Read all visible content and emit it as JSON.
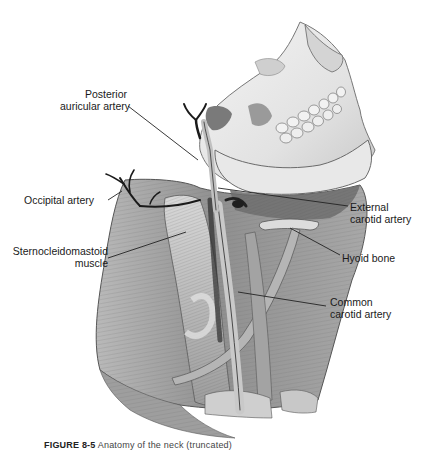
{
  "figure": {
    "style": "grayscale pencil illustration",
    "colors": {
      "background": "#ffffff",
      "text": "#1a1a1a",
      "leader_line": "#222222",
      "bone": "#e6e6e6",
      "muscle": "#9a9a9a",
      "artery": "#2a2a2a"
    }
  },
  "labels": {
    "posterior_auricular": {
      "line1": "Posterior",
      "line2": "auricular artery"
    },
    "occipital": {
      "line1": "Occipital artery"
    },
    "sternocleidomastoid": {
      "line1": "Sternocleidomastoid",
      "line2": "muscle"
    },
    "external_carotid": {
      "line1": "External",
      "line2": "carotid artery"
    },
    "hyoid": {
      "line1": "Hyoid bone"
    },
    "common_carotid": {
      "line1": "Common",
      "line2": "carotid artery"
    }
  },
  "caption": {
    "prefix": "FIGURE 8-5",
    "text": "Anatomy of the neck (truncated)"
  }
}
